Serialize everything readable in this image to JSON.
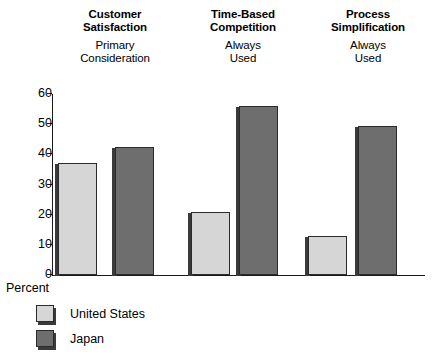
{
  "chart_data": {
    "type": "bar",
    "title": "",
    "xlabel": "",
    "ylabel": "Percent",
    "ylim": [
      0,
      60
    ],
    "yticks": [
      0,
      10,
      20,
      30,
      40,
      50,
      60
    ],
    "grid": false,
    "legend_position": "bottom-left",
    "categories": [
      "Customer Satisfaction",
      "Time-Based Competition",
      "Process Simplification"
    ],
    "category_subtitles": [
      "Primary Consideration",
      "Always Used",
      "Always Used"
    ],
    "series": [
      {
        "name": "United States",
        "color": "#d6d6d6",
        "values": [
          37,
          21,
          13
        ]
      },
      {
        "name": "Japan",
        "color": "#6e6e6e",
        "values": [
          42.5,
          56,
          49.5
        ]
      }
    ]
  },
  "groups": [
    {
      "title_line1": "Customer",
      "title_line2": "Satisfaction",
      "sub_line1": "Primary",
      "sub_line2": "Consideration"
    },
    {
      "title_line1": "Time-Based",
      "title_line2": "Competition",
      "sub_line1": "Always",
      "sub_line2": "Used"
    },
    {
      "title_line1": "Process",
      "title_line2": "Simplification",
      "sub_line1": "Always",
      "sub_line2": "Used"
    }
  ],
  "axis": {
    "tick_0": "0",
    "tick_10": "10",
    "tick_20": "20",
    "tick_30": "30",
    "tick_40": "40",
    "tick_50": "50",
    "tick_60": "60",
    "percent_label": "Percent"
  },
  "legend": {
    "items": [
      {
        "label": "United States",
        "color": "#d6d6d6"
      },
      {
        "label": "Japan",
        "color": "#6e6e6e"
      }
    ]
  }
}
